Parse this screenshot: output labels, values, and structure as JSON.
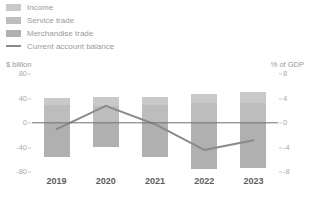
{
  "legend": {
    "items": [
      {
        "label": "Income",
        "type": "swatch",
        "color": "#c9c9c9"
      },
      {
        "label": "Service trade",
        "type": "swatch",
        "color": "#bdbdbd"
      },
      {
        "label": "Merchandise trade",
        "type": "swatch",
        "color": "#b0b0b0"
      },
      {
        "label": "Current account balance",
        "type": "line",
        "color": "#8a8a8a"
      }
    ]
  },
  "axes": {
    "left_unit": "$ billion",
    "right_unit": "% of GDP",
    "left_ticks": [
      "80",
      "40",
      "0",
      "-40",
      "-80"
    ],
    "right_ticks": [
      "8",
      "4",
      "0",
      "-4",
      "-8"
    ]
  },
  "chart_data": {
    "type": "bar",
    "title": "",
    "subtitle": "",
    "xlabel": "",
    "ylabel": "$ billion",
    "y2label": "% of GDP",
    "categories": [
      "2019",
      "2020",
      "2021",
      "2022",
      "2023"
    ],
    "ylim": [
      -80,
      80
    ],
    "y2lim": [
      -8,
      8
    ],
    "grid": false,
    "legend_position": "top-left",
    "stacked": true,
    "series": [
      {
        "name": "Merchandise trade",
        "axis": "left",
        "color": "#b0b0b0",
        "values": [
          -55,
          -39,
          -56,
          -75,
          -73
        ]
      },
      {
        "name": "Service trade",
        "axis": "left",
        "color": "#bdbdbd",
        "values": [
          29,
          28,
          30,
          33,
          33
        ]
      },
      {
        "name": "Income",
        "axis": "left",
        "color": "#c9c9c9",
        "values": [
          12,
          14,
          13,
          15,
          18
        ]
      }
    ],
    "line_series": [
      {
        "name": "Current account balance",
        "axis": "right",
        "color": "#8a8a8a",
        "type": "line",
        "values": [
          -1.0,
          2.8,
          -0.2,
          -4.4,
          -2.8
        ]
      }
    ]
  },
  "footer": {
    "cropped_text": ""
  }
}
